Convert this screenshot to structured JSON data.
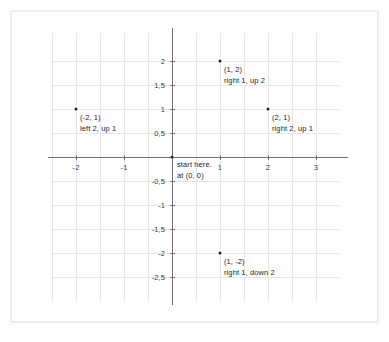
{
  "figure": {
    "type": "coordinate-plane",
    "title": "",
    "paper": {
      "background_color": "#fefefe",
      "edge_color": "#ececec"
    },
    "style": {
      "grid_color": "#e6e6e9",
      "axis_color": "#6f6f73",
      "text_color": "#26262a",
      "point_color": "#2a2a2e",
      "decimal_separator": ","
    }
  },
  "chart_data": {
    "type": "scatter",
    "title": "",
    "xlabel": "",
    "ylabel": "",
    "xlim": [
      -2.5,
      3.25
    ],
    "ylim": [
      -2.75,
      2.3
    ],
    "grid": true,
    "grid_step": 0.5,
    "legend": "none",
    "x_ticks": [
      {
        "value": -2,
        "label": "-2"
      },
      {
        "value": -1,
        "label": "-1"
      },
      {
        "value": 1,
        "label": "1"
      },
      {
        "value": 2,
        "label": "2"
      },
      {
        "value": 3,
        "label": "3"
      }
    ],
    "y_ticks": [
      {
        "value": 2,
        "label": "2"
      },
      {
        "value": 1.5,
        "label": "1,5"
      },
      {
        "value": 1,
        "label": "1"
      },
      {
        "value": 0.5,
        "label": "0,5"
      },
      {
        "value": -0.5,
        "label": "-0,5"
      },
      {
        "value": -1,
        "label": "-1"
      },
      {
        "value": -1.5,
        "label": "-1,5"
      },
      {
        "value": -2,
        "label": "-2"
      },
      {
        "value": -2.5,
        "label": "-2,5"
      }
    ],
    "points": [
      {
        "id": "point-1-2",
        "x": 1,
        "y": 2,
        "coord_label": "(1, 2)",
        "direction_label": "right 1, up 2"
      },
      {
        "id": "point-neg2-1",
        "x": -2,
        "y": 1,
        "coord_label": "(-2, 1)",
        "direction_label": "left 2, up 1"
      },
      {
        "id": "point-2-1",
        "x": 2,
        "y": 1,
        "coord_label": "(2, 1)",
        "direction_label": "right 2, up 1"
      },
      {
        "id": "point-1-neg2",
        "x": 1,
        "y": -2,
        "coord_label": "(1, -2)",
        "direction_label": "right 1, down 2"
      }
    ],
    "origin": {
      "id": "origin",
      "x": 0,
      "y": 0,
      "line1": "start here.",
      "line2": "at (0, 0)"
    }
  }
}
